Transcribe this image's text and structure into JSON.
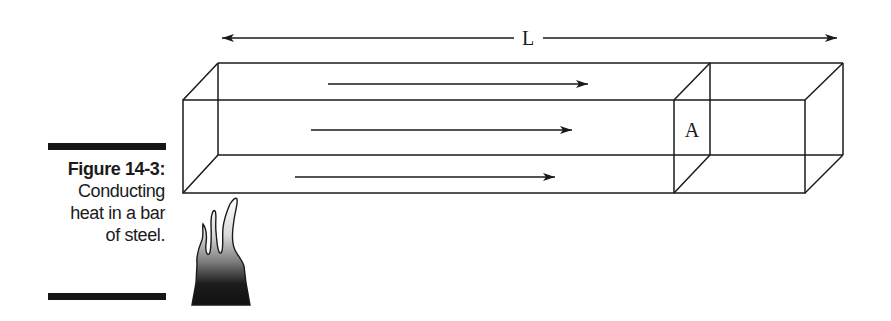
{
  "figure": {
    "number_label": "Figure 14-3:",
    "caption_lines": [
      "Conducting",
      "heat in a bar",
      "of steel."
    ]
  },
  "diagram": {
    "length_label": "L",
    "area_label": "A",
    "heat_flow_arrows": 3,
    "heat_source": "flame"
  },
  "colors": {
    "line": "#1a1a1a",
    "background": "#ffffff",
    "caption_bar": "#161616"
  }
}
